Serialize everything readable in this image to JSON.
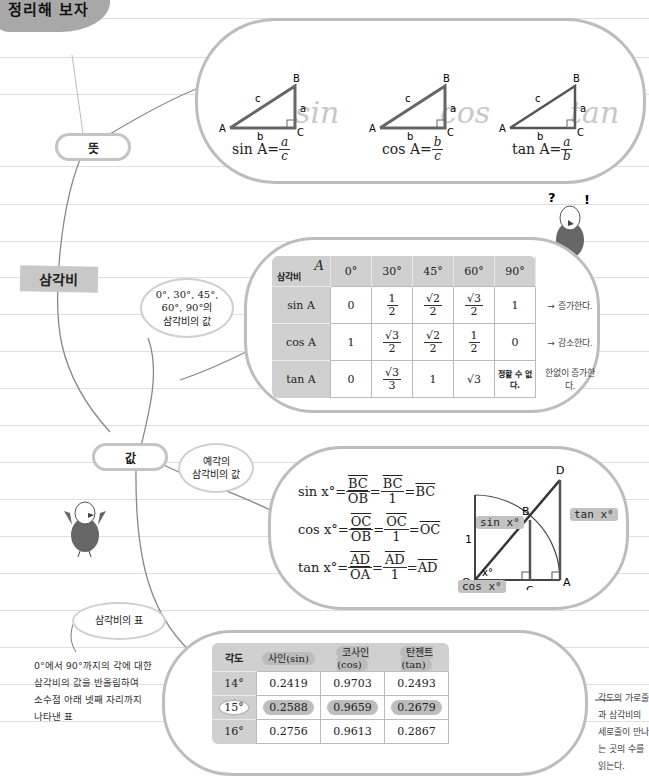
{
  "header": {
    "title": "정리해 보자"
  },
  "mindmap": {
    "root": "삼각비",
    "branches": {
      "meaning": "뜻",
      "value": "값",
      "special_angles_label": [
        "0°, 30°, 45°,",
        "60°, 90°의",
        "삼각비의 값"
      ],
      "acute_label": [
        "예각의",
        "삼각비의 값"
      ],
      "table_label": "삼각비의 표"
    }
  },
  "definitions": {
    "triangle_vertices": [
      "A",
      "B",
      "C"
    ],
    "triangle_sides": [
      "a",
      "b",
      "c"
    ],
    "script_words": [
      "sin",
      "cos",
      "tan"
    ],
    "formulas": [
      {
        "lhs": "sin A=",
        "num": "a",
        "den": "c"
      },
      {
        "lhs": "cos A=",
        "num": "b",
        "den": "c"
      },
      {
        "lhs": "tan A=",
        "num": "a",
        "den": "b"
      }
    ]
  },
  "mascot_marks": [
    "?",
    "!"
  ],
  "special_table": {
    "corner_top": "A",
    "corner_bottom": "삼각비",
    "angles": [
      "0°",
      "30°",
      "45°",
      "60°",
      "90°"
    ],
    "rows": [
      {
        "name": "sin A",
        "values": [
          "0",
          "1/2",
          "√2/2",
          "√3/2",
          "1"
        ],
        "trend": "증가한다."
      },
      {
        "name": "cos A",
        "values": [
          "1",
          "√3/2",
          "√2/2",
          "1/2",
          "0"
        ],
        "trend": "감소한다."
      },
      {
        "name": "tan A",
        "values": [
          "0",
          "√3/3",
          "1",
          "√3",
          "정할 수 없다."
        ],
        "trend": "한없이 증가한다."
      }
    ]
  },
  "unit_circle": {
    "formulas": [
      {
        "lhs": "sin x°=",
        "f1_num": "BC",
        "f1_den": "OB",
        "f2_num": "BC",
        "f2_den": "1",
        "result": "BC"
      },
      {
        "lhs": "cos x°=",
        "f1_num": "OC",
        "f1_den": "OB",
        "f2_num": "OC",
        "f2_den": "1",
        "result": "OC"
      },
      {
        "lhs": "tan x°=",
        "f1_num": "AD",
        "f1_den": "OA",
        "f2_num": "AD",
        "f2_den": "1",
        "result": "AD"
      }
    ],
    "points": [
      "O",
      "A",
      "B",
      "C",
      "D"
    ],
    "radius_label": "1",
    "angle_label": "x°",
    "tags": {
      "sin": "sin x°",
      "cos": "cos x°",
      "tan": "tan x°"
    }
  },
  "trig_table": {
    "headers": [
      "각도",
      "사인(sin)",
      "코사인(cos)",
      "탄젠트(tan)"
    ],
    "rows": [
      {
        "angle": "14°",
        "sin": "0.2419",
        "cos": "0.9703",
        "tan": "0.2493"
      },
      {
        "angle": "15°",
        "sin": "0.2588",
        "cos": "0.9659",
        "tan": "0.2679",
        "highlight": true
      },
      {
        "angle": "16°",
        "sin": "0.2756",
        "cos": "0.9613",
        "tan": "0.2867"
      }
    ],
    "description": [
      "0°에서 90°까지의 각에 대한",
      "삼각비의 값을 반올림하여",
      "소수점 아래 넷째 자리까지",
      "나타낸 표"
    ],
    "reading_note": [
      "각도의 가로줄과 삼각비의",
      "세로줄이 만나는 곳의 수를",
      "읽는다."
    ]
  },
  "colors": {
    "bubble_border": "#bdbdbd",
    "header_fill": "#d0d0d0",
    "title_blob": "#a8a8a8"
  }
}
